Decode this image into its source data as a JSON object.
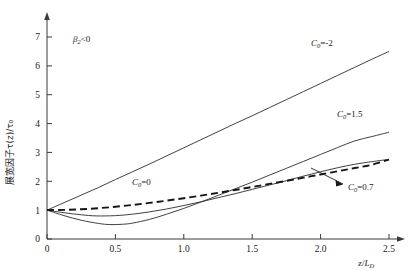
{
  "chart_data": {
    "type": "line",
    "title": "",
    "subtitle": "",
    "xlabel": "z/L_D",
    "ylabel": "展宽因子τ(z)/τ₀",
    "xlim": [
      0,
      2.62
    ],
    "ylim": [
      0,
      7.35
    ],
    "xticks": [
      "0",
      "0.5",
      "1.0",
      "1.5",
      "2.0",
      "2.5"
    ],
    "xtick_values": [
      0,
      0.5,
      1.0,
      1.5,
      2.0,
      2.5
    ],
    "yticks": [
      "0",
      "1",
      "2",
      "3",
      "4",
      "5",
      "6",
      "7"
    ],
    "ytick_values": [
      0,
      1,
      2,
      3,
      4,
      5,
      6,
      7
    ],
    "grid": false,
    "legend_position": "inline-annotations",
    "annotations": [
      {
        "name": "beta2-condition",
        "text": "β₂<0",
        "x": 0.33,
        "y": 6.9
      }
    ],
    "series": [
      {
        "name": "C0 = -2",
        "label": "C₀=-2",
        "chirp": -2,
        "style": "solid",
        "label_x": 1.92,
        "label_y": 6.55,
        "x": [
          0,
          0.125,
          0.25,
          0.375,
          0.5,
          0.625,
          0.75,
          0.875,
          1.0,
          1.125,
          1.25,
          1.375,
          1.5,
          1.625,
          1.75,
          1.875,
          2.0,
          2.125,
          2.25,
          2.375,
          2.5
        ],
        "y": [
          1.0,
          1.26,
          1.52,
          1.78,
          2.06,
          2.33,
          2.6,
          2.88,
          3.16,
          3.44,
          3.72,
          4.0,
          4.27,
          4.55,
          4.83,
          5.11,
          5.39,
          5.67,
          5.95,
          6.23,
          6.5
        ]
      },
      {
        "name": "C0 = 1.5",
        "label": "C₀=1.5",
        "chirp": 1.5,
        "style": "solid",
        "label_x": 2.03,
        "label_y": 4.0,
        "minimum_x": 0.46,
        "minimum_y": 0.5,
        "x": [
          0,
          0.125,
          0.25,
          0.375,
          0.46,
          0.55,
          0.625,
          0.75,
          0.875,
          1.0,
          1.125,
          1.25,
          1.375,
          1.5,
          1.625,
          1.75,
          1.875,
          2.0,
          2.125,
          2.25,
          2.375,
          2.5
        ],
        "y": [
          1.0,
          0.81,
          0.65,
          0.54,
          0.5,
          0.51,
          0.55,
          0.68,
          0.86,
          1.06,
          1.28,
          1.51,
          1.74,
          1.97,
          2.21,
          2.45,
          2.69,
          2.93,
          3.17,
          3.4,
          3.55,
          3.7
        ]
      },
      {
        "name": "C0 = 0",
        "label": "C₀=0",
        "chirp": 0,
        "style": "dashed",
        "label_x": 0.68,
        "label_y": 1.55,
        "x": [
          0,
          0.125,
          0.25,
          0.375,
          0.5,
          0.625,
          0.75,
          0.875,
          1.0,
          1.125,
          1.25,
          1.375,
          1.5,
          1.625,
          1.75,
          1.875,
          2.0,
          2.125,
          2.25,
          2.375,
          2.5
        ],
        "y": [
          1.0,
          1.008,
          1.031,
          1.068,
          1.118,
          1.179,
          1.25,
          1.329,
          1.414,
          1.504,
          1.6,
          1.699,
          1.803,
          1.909,
          2.016,
          2.126,
          2.236,
          2.348,
          2.46,
          2.573,
          2.75
        ]
      },
      {
        "name": "C0 = 0.7",
        "label": "C₀=0.7",
        "chirp": 0.7,
        "style": "solid",
        "label_x": 2.1,
        "label_y": 1.5,
        "minimum_x": 0.36,
        "minimum_y": 0.8,
        "x": [
          0,
          0.125,
          0.25,
          0.36,
          0.5,
          0.625,
          0.75,
          0.875,
          1.0,
          1.125,
          1.25,
          1.375,
          1.5,
          1.625,
          1.75,
          1.875,
          2.0,
          2.125,
          2.25,
          2.375,
          2.5
        ],
        "y": [
          1.0,
          0.91,
          0.84,
          0.8,
          0.81,
          0.86,
          0.94,
          1.04,
          1.16,
          1.29,
          1.43,
          1.57,
          1.72,
          1.87,
          2.02,
          2.18,
          2.33,
          2.47,
          2.59,
          2.68,
          2.76
        ]
      }
    ],
    "callout": {
      "name": "c0-07-pointer",
      "from_label": "C₀=0.7",
      "to_x": 1.78,
      "to_y": 1.95
    }
  }
}
